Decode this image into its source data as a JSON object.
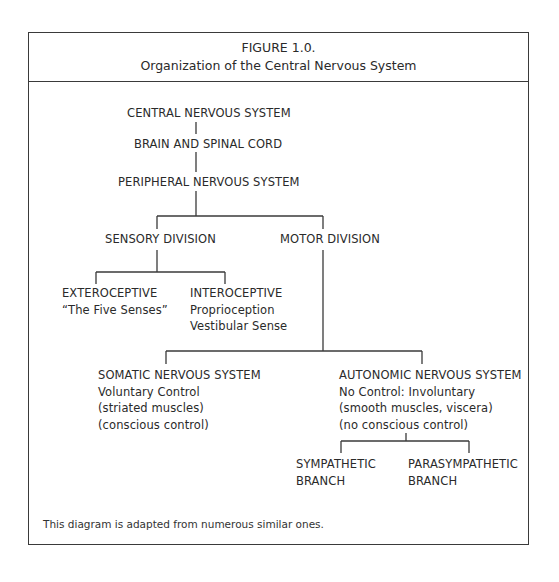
{
  "figure": {
    "label": "FIGURE 1.0.",
    "title": "Organization of the Central Nervous System",
    "footnote": "This diagram is adapted from numerous similar ones."
  },
  "nodes": {
    "cns": {
      "lines": [
        "CENTRAL NERVOUS SYSTEM"
      ]
    },
    "brain_spinal": {
      "lines": [
        "BRAIN AND SPINAL CORD"
      ]
    },
    "pns": {
      "lines": [
        "PERIPHERAL NERVOUS SYSTEM"
      ]
    },
    "sensory": {
      "lines": [
        "SENSORY DIVISION"
      ]
    },
    "motor": {
      "lines": [
        "MOTOR DIVISION"
      ]
    },
    "exteroceptive": {
      "lines": [
        "EXTEROCEPTIVE",
        "“The Five Senses”"
      ]
    },
    "interoceptive": {
      "lines": [
        "INTEROCEPTIVE",
        "Proprioception",
        "Vestibular Sense"
      ]
    },
    "somatic": {
      "lines": [
        "SOMATIC NERVOUS SYSTEM",
        "Voluntary Control",
        "(striated muscles)",
        "(conscious control)"
      ]
    },
    "autonomic": {
      "lines": [
        "AUTONOMIC NERVOUS SYSTEM",
        "No Control: Involuntary",
        "(smooth muscles, viscera)",
        "(no conscious control)"
      ]
    },
    "sympathetic": {
      "lines": [
        "SYMPATHETIC",
        "BRANCH"
      ]
    },
    "parasympathetic": {
      "lines": [
        "PARASYMPATHETIC",
        "BRANCH"
      ]
    }
  },
  "colors": {
    "line": "#3a3a3a",
    "text": "#2a2a2a",
    "background": "#ffffff"
  }
}
